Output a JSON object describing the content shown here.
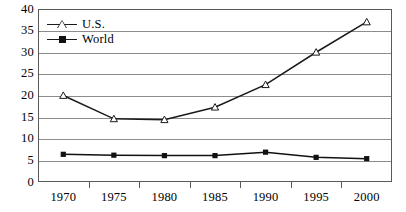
{
  "chart_data": {
    "type": "line",
    "title": "",
    "subtitle": "",
    "xlabel": "",
    "ylabel": "",
    "categories": [
      "1970",
      "1975",
      "1980",
      "1985",
      "1990",
      "1995",
      "2000"
    ],
    "ylim": [
      0,
      40
    ],
    "ytick_step": 5,
    "yticks": [
      "0",
      "5",
      "10",
      "15",
      "20",
      "25",
      "30",
      "35",
      "40"
    ],
    "grid": true,
    "grid_axis": "y",
    "legend_position": "upper-left-inside",
    "series": [
      {
        "name": "U.S.",
        "marker": "open-triangle",
        "color": "#1a1a1a",
        "values": [
          20.0,
          14.6,
          14.4,
          17.3,
          22.5,
          30.0,
          37.0
        ]
      },
      {
        "name": "World",
        "marker": "filled-square",
        "color": "#111111",
        "values": [
          6.4,
          6.2,
          6.1,
          6.1,
          6.9,
          5.7,
          5.4
        ]
      }
    ],
    "annotations": []
  },
  "legend": {
    "items": [
      {
        "label": "U.S.",
        "marker": "open-triangle-marker"
      },
      {
        "label": "World",
        "marker": "filled-square-marker"
      }
    ]
  },
  "colors": {
    "frame": "#595959",
    "gridline": "#8c8c8c",
    "series_us": "#1a1a1a",
    "series_world": "#111111",
    "background": "#ffffff"
  }
}
